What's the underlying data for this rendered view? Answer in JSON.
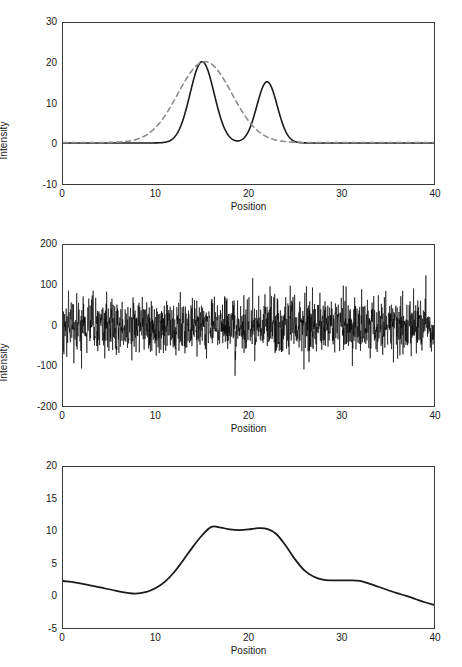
{
  "figure": {
    "background": "#ffffff",
    "axis_color": "#3a3a3a",
    "solid_color": "#1a1a1a",
    "dashed_color": "#8c8c8c"
  },
  "chart_data": [
    {
      "type": "line",
      "panel": 1,
      "title": "",
      "xlabel": "Position",
      "ylabel": "Intensity",
      "xlim": [
        0,
        40
      ],
      "ylim": [
        -10,
        30
      ],
      "xticks": [
        0,
        10,
        20,
        30,
        40
      ],
      "xticklabels": [
        "0",
        "10",
        "20",
        "30",
        "40"
      ],
      "yticks": [
        -10,
        0,
        10,
        20,
        30
      ],
      "yticklabels": [
        "-10",
        "0",
        "10",
        "20",
        "30"
      ],
      "grid": false,
      "legend": "none",
      "series": [
        {
          "name": "true-signal",
          "style": "solid",
          "color": "#1a1a1a",
          "width": 1.6,
          "description": "two Gaussian peaks, sigma 1.3 at position 15 height 20.2, sigma 1.1 at position 22 height 15.2, baseline 0.2",
          "peaks": [
            {
              "center": 15.0,
              "height": 20.2,
              "sigma": 1.3
            },
            {
              "center": 22.0,
              "height": 15.2,
              "sigma": 1.1
            }
          ],
          "baseline": 0.2
        },
        {
          "name": "blurred-signal",
          "style": "dashed",
          "color": "#8c8c8c",
          "width": 1.6,
          "description": "single broad Gaussian, sigma 2.9 at position 15.3 height 20.1, baseline 0.3",
          "peaks": [
            {
              "center": 15.3,
              "height": 20.1,
              "sigma": 2.9
            }
          ],
          "baseline": 0.3
        }
      ]
    },
    {
      "type": "line",
      "panel": 2,
      "title": "",
      "xlabel": "Position",
      "ylabel": "Intensity",
      "xlim": [
        0,
        40
      ],
      "ylim": [
        -200,
        200
      ],
      "xticks": [
        0,
        10,
        20,
        30,
        40
      ],
      "xticklabels": [
        "0",
        "10",
        "20",
        "30",
        "40"
      ],
      "yticks": [
        -200,
        -100,
        0,
        100,
        200
      ],
      "yticklabels": [
        "-200",
        "-100",
        "0",
        "100",
        "200"
      ],
      "grid": false,
      "legend": "none",
      "series": [
        {
          "name": "noise-trace",
          "style": "solid",
          "color": "#000000",
          "width": 0.6,
          "description": "dense zero-mean white noise, ~1600 samples, standard deviation about 35, envelope mostly within +/-90 with occasional spikes to +/-125",
          "n_points": 1600,
          "mean": 0,
          "std": 35,
          "max_observed": 125,
          "min_observed": -125,
          "seed": 20250419
        }
      ]
    },
    {
      "type": "line",
      "panel": 3,
      "title": "",
      "xlabel": "Position",
      "ylabel": "Intensity",
      "xlim": [
        0,
        40
      ],
      "ylim": [
        -5,
        20
      ],
      "xticks": [
        0,
        10,
        20,
        30,
        40
      ],
      "xticklabels": [
        "0",
        "10",
        "20",
        "30",
        "40"
      ],
      "yticks": [
        -5,
        0,
        5,
        10,
        15,
        20
      ],
      "yticklabels": [
        "-5",
        "0",
        "5",
        "10",
        "15",
        "20"
      ],
      "grid": false,
      "legend": "none",
      "series": [
        {
          "name": "recovered-signal",
          "style": "solid",
          "color": "#1a1a1a",
          "width": 1.8,
          "description": "smooth low-frequency curve: starts 2.3, dips to 0.35 near x=7.7, rises to plateau ~10.7 at x=16, shallow dip 10.2 at x=19, small rise 10.5 at x=21, falls to shelf 2.4 between x=28 and x=32, then declines to -1.4 at x=40",
          "points": [
            [
              0.0,
              2.3
            ],
            [
              2.0,
              1.9
            ],
            [
              4.0,
              1.3
            ],
            [
              6.0,
              0.7
            ],
            [
              7.7,
              0.35
            ],
            [
              9.0,
              0.6
            ],
            [
              10.0,
              1.2
            ],
            [
              11.0,
              2.2
            ],
            [
              12.0,
              3.7
            ],
            [
              13.0,
              5.6
            ],
            [
              14.0,
              7.6
            ],
            [
              15.0,
              9.4
            ],
            [
              16.0,
              10.7
            ],
            [
              17.0,
              10.6
            ],
            [
              18.0,
              10.3
            ],
            [
              19.0,
              10.2
            ],
            [
              20.0,
              10.3
            ],
            [
              21.0,
              10.5
            ],
            [
              22.0,
              10.4
            ],
            [
              23.0,
              9.6
            ],
            [
              24.0,
              7.8
            ],
            [
              25.0,
              5.7
            ],
            [
              26.0,
              4.0
            ],
            [
              27.0,
              3.0
            ],
            [
              28.0,
              2.5
            ],
            [
              29.0,
              2.4
            ],
            [
              30.0,
              2.4
            ],
            [
              31.0,
              2.4
            ],
            [
              32.0,
              2.3
            ],
            [
              33.0,
              1.9
            ],
            [
              34.0,
              1.4
            ],
            [
              35.0,
              0.9
            ],
            [
              36.0,
              0.4
            ],
            [
              37.0,
              0.0
            ],
            [
              38.0,
              -0.5
            ],
            [
              39.0,
              -1.0
            ],
            [
              40.0,
              -1.4
            ]
          ]
        }
      ]
    }
  ]
}
